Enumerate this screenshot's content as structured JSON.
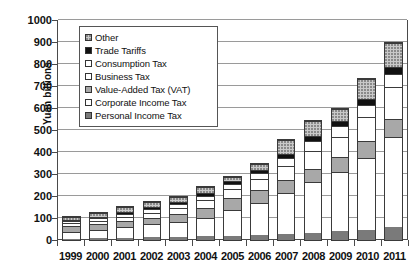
{
  "chart_data": {
    "type": "bar",
    "subtype": "stacked-bar",
    "title": "",
    "xlabel": "",
    "ylabel": "Yuan billions",
    "ylim": [
      0,
      1000
    ],
    "ytick_step": 100,
    "yticks": [
      0,
      100,
      200,
      300,
      400,
      500,
      600,
      700,
      800,
      900,
      1000
    ],
    "ytick_labels": [
      "0",
      "100",
      "200",
      "300",
      "400",
      "500",
      "600",
      "700",
      "800",
      "900",
      "1000"
    ],
    "grid": true,
    "legend_position": "upper-left-inside",
    "categories": [
      "1999",
      "2000",
      "2001",
      "2002",
      "2003",
      "2004",
      "2005",
      "2006",
      "2007",
      "2008",
      "2009",
      "2010",
      "2011"
    ],
    "stack_order_bottom_to_top": [
      "Personal Income Tax",
      "Corporate Income Tax",
      "Value-Added Tax (VAT)",
      "Business Tax",
      "Consumption Tax",
      "Trade Tariffs",
      "Other"
    ],
    "series": [
      {
        "name": "Personal Income Tax",
        "color": "#7a7a7a",
        "pattern": "solid-dark-gray",
        "values": [
          4,
          7,
          10,
          12,
          12,
          17,
          20,
          24,
          28,
          34,
          39,
          46,
          60
        ]
      },
      {
        "name": "Corporate Income Tax",
        "color": "#ffffff",
        "pattern": "solid-white",
        "values": [
          33,
          40,
          50,
          60,
          70,
          85,
          115,
          145,
          185,
          230,
          270,
          325,
          410
        ]
      },
      {
        "name": "Value-Added Tax (VAT)",
        "color": "#a8a8a8",
        "pattern": "solid-medium-gray",
        "values": [
          28,
          25,
          25,
          30,
          35,
          43,
          55,
          57,
          60,
          60,
          70,
          80,
          82
        ]
      },
      {
        "name": "Business Tax",
        "color": "#ffffff",
        "pattern": "solid-white",
        "values": [
          12,
          14,
          20,
          22,
          27,
          35,
          40,
          50,
          65,
          80,
          90,
          110,
          145
        ]
      },
      {
        "name": "Consumption Tax",
        "color": "#ffffff",
        "pattern": "solid-white",
        "values": [
          10,
          12,
          15,
          18,
          20,
          22,
          25,
          28,
          35,
          45,
          50,
          55,
          60
        ]
      },
      {
        "name": "Trade Tariffs",
        "color": "#111111",
        "pattern": "solid-black",
        "values": [
          5,
          6,
          8,
          9,
          10,
          12,
          14,
          16,
          18,
          22,
          22,
          24,
          30
        ]
      },
      {
        "name": "Other",
        "color": "#c9c9c9",
        "pattern": "dotted-light-gray",
        "values": [
          11,
          21,
          22,
          20,
          21,
          26,
          17,
          25,
          63,
          70,
          54,
          90,
          108
        ]
      }
    ],
    "totals": [
      103,
      125,
      150,
      171,
      195,
      240,
      286,
      345,
      454,
      541,
      595,
      730,
      895
    ]
  },
  "legend": {
    "items": [
      {
        "label": "Other",
        "swatch": "dotted-light-gray"
      },
      {
        "label": "Trade Tariffs",
        "swatch": "solid-black"
      },
      {
        "label": "Consumption Tax",
        "swatch": "solid-white"
      },
      {
        "label": "Business Tax",
        "swatch": "solid-white"
      },
      {
        "label": "Value-Added Tax (VAT)",
        "swatch": "solid-medium-gray"
      },
      {
        "label": "Corporate Income Tax",
        "swatch": "solid-white"
      },
      {
        "label": "Personal Income Tax",
        "swatch": "solid-dark-gray"
      }
    ]
  }
}
